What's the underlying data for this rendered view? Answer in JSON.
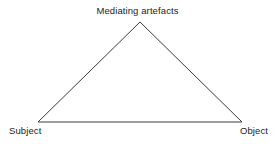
{
  "diagram": {
    "type": "activity-theory-triangle",
    "canvas": {
      "width": 277,
      "height": 144
    },
    "background_color": "#ffffff",
    "stroke_color": "#3a3a3a",
    "stroke_width": 1,
    "text_color": "#1c1c1c",
    "nodes": {
      "apex": {
        "label": "Mediating artefacts",
        "x": 140,
        "y": 22
      },
      "bottom_left": {
        "label": "Subject",
        "x": 38,
        "y": 122
      },
      "bottom_right": {
        "label": "Object",
        "x": 242,
        "y": 122
      }
    },
    "edges": [
      {
        "from": "bottom_left",
        "to": "apex"
      },
      {
        "from": "apex",
        "to": "bottom_right"
      },
      {
        "from": "bottom_left",
        "to": "bottom_right"
      }
    ],
    "polygon_points": "38,122 140,22 242,122"
  }
}
